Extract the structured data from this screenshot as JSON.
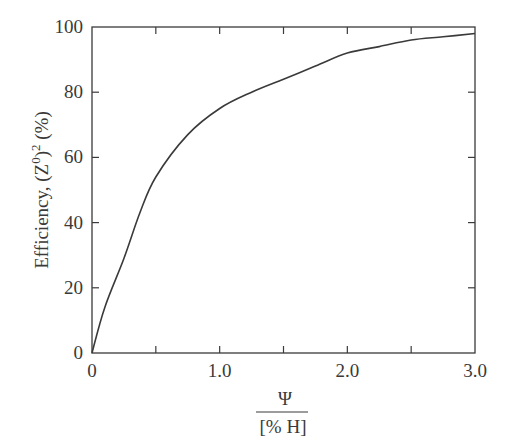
{
  "chart_data": {
    "type": "line",
    "title": "",
    "xlabel": "Ψ / [% H]",
    "xlabel_numerator": "Ψ",
    "xlabel_denominator": "[% H]",
    "ylabel": "Efficiency, (Z0)2 (%)",
    "ylabel_parts": {
      "main": "Efficiency, (Z",
      "sup1": "0",
      "mid": ")",
      "sup2": "2",
      "end": " (%)"
    },
    "xlim": [
      0,
      3.0
    ],
    "ylim": [
      0,
      100
    ],
    "x_ticks": [
      0,
      0.5,
      1.0,
      1.5,
      2.0,
      2.5,
      3.0
    ],
    "x_tick_labels": [
      {
        "value": 0,
        "label": "0"
      },
      {
        "value": 1.0,
        "label": "1.0"
      },
      {
        "value": 2.0,
        "label": "2.0"
      },
      {
        "value": 3.0,
        "label": "3.0"
      }
    ],
    "y_ticks": [
      0,
      20,
      40,
      60,
      80,
      100
    ],
    "y_tick_labels": [
      "0",
      "20",
      "40",
      "60",
      "80",
      "100"
    ],
    "grid": false,
    "legend": null,
    "series": [
      {
        "name": "Efficiency",
        "x": [
          0,
          0.1,
          0.25,
          0.375,
          0.5,
          0.75,
          1.0,
          1.25,
          1.5,
          1.75,
          2.0,
          2.25,
          2.5,
          2.75,
          3.0
        ],
        "y": [
          0,
          14,
          29,
          43,
          54,
          67,
          75,
          80,
          84,
          88,
          92,
          94,
          96,
          97,
          98
        ]
      }
    ]
  },
  "colors": {
    "line": "#3a3a3a",
    "axes": "#3a3a3a",
    "background": "#ffffff"
  }
}
